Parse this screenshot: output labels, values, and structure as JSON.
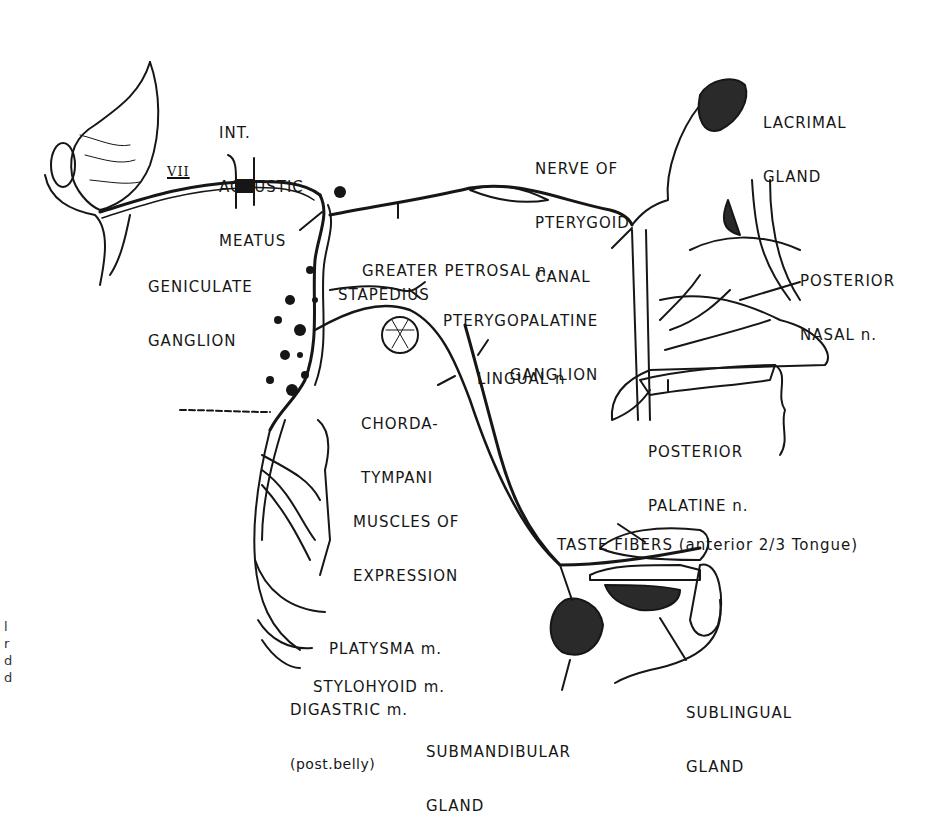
{
  "diagram": {
    "nerve_label": "VII",
    "labels": {
      "int_acoustic_meatus": [
        "INT.",
        "ACOUSTIC",
        "MEATUS"
      ],
      "geniculate_ganglion": [
        "GENICULATE",
        "GANGLION"
      ],
      "greater_petrosal": [
        "GREATER PETROSAL n."
      ],
      "stapedius": [
        "STAPEDIUS"
      ],
      "nerve_of_pterygoid_canal": [
        "NERVE OF",
        "PTERYGOID",
        "CANAL"
      ],
      "pterygopalatine_ganglion": [
        "PTERYGOPALATINE",
        "GANGLION"
      ],
      "lacrimal_gland": [
        "LACRIMAL",
        "GLAND"
      ],
      "posterior_nasal": [
        "POSTERIOR",
        "NASAL n."
      ],
      "lingual": [
        "LINGUAL n"
      ],
      "chorda_tympani": [
        "CHORDA-",
        "TYMPANI"
      ],
      "posterior_palatine": [
        "POSTERIOR",
        "PALATINE n."
      ],
      "muscles_of_expression": [
        "MUSCLES OF",
        "EXPRESSION"
      ],
      "taste_fibers": [
        "TASTE FIBERS (anterior 2/3 Tongue)"
      ],
      "platysma": [
        "PLATYSMA m."
      ],
      "stylohyoid": [
        "STYLOHYOID m."
      ],
      "digastric": [
        "DIGASTRIC m.",
        "(post.belly)"
      ],
      "submandibular_gland": [
        "SUBMANDIBULAR",
        "GLAND"
      ],
      "sublingual_gland": [
        "SUBLINGUAL",
        "GLAND"
      ]
    },
    "edge_fragments": [
      "l",
      "r",
      "d",
      "d"
    ]
  },
  "colors": {
    "ink": "#161616",
    "background": "#ffffff"
  }
}
